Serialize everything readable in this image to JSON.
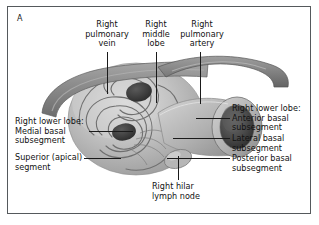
{
  "figure": {
    "panel_letter": "A",
    "domain": "anatomical-illustration",
    "background_color": "#ffffff",
    "border_color": "#55595c",
    "text_color": "#121212",
    "illustration_palette": {
      "vessel_gray": "#8c8c8c",
      "vessel_dark": "#6a6a6a",
      "mass_light": "#c9c9c9",
      "mass_mid": "#a5a5a5",
      "lumen_dark": "#3b3b3b",
      "highlight": "#e6e6e6"
    }
  },
  "labels": {
    "top": [
      {
        "id": "right-pulmonary-vein",
        "text": "Right\npulmonary\nvein"
      },
      {
        "id": "right-middle-lobe",
        "text": "Right\nmiddle\nlobe"
      },
      {
        "id": "right-pulmonary-artery",
        "text": "Right\npulmonary\nartery"
      }
    ],
    "left": [
      {
        "id": "medial-basal-subsegment",
        "text": "Right lower lobe:\nMedial basal\nsubsegment"
      },
      {
        "id": "superior-apical-segment",
        "text": "Superior (apical)\nsegment"
      }
    ],
    "right": [
      {
        "id": "anterior-basal-subsegment",
        "text": "Right lower lobe:\nAnterior basal\nsubsegment"
      },
      {
        "id": "lateral-basal-subsegment",
        "text": "Lateral basal\nsubsegment"
      },
      {
        "id": "posterior-basal-subsegment",
        "text": "Posterior basal\nsubsegment"
      }
    ],
    "bottom": [
      {
        "id": "right-hilar-lymph-node",
        "text": "Right hilar\nlymph node"
      }
    ]
  }
}
